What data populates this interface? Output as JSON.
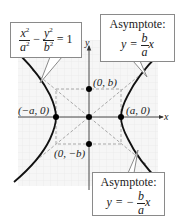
{
  "diagram": {
    "type": "hyperbola-with-asymptotes",
    "equation_callout": {
      "x_term_num": "x",
      "x_term_den": "a",
      "exp": "2",
      "minus": "−",
      "y_term_num": "y",
      "y_term_den": "b",
      "rhs": "= 1"
    },
    "asymptote_upper": {
      "title": "Asymptote:",
      "lhs": "y =",
      "num": "b",
      "den": "a",
      "var": "x"
    },
    "asymptote_lower": {
      "title": "Asymptote:",
      "lhs": "y = −",
      "num": "b",
      "den": "a",
      "var": "x"
    },
    "axes": {
      "x_label": "x",
      "y_label": "y"
    },
    "points": {
      "vertex_left": "(−a, 0)",
      "vertex_right": "(a, 0)",
      "co_vertex_top": "(0, b)",
      "co_vertex_bottom": "(0, −b)"
    },
    "colors": {
      "curve": "#111111",
      "axes": "#333333",
      "dashed": "#a8a8a8",
      "grid": "#e2e2e2",
      "grid_bg": "#f4f4f4",
      "callout_border": "#8a8a8a"
    }
  }
}
